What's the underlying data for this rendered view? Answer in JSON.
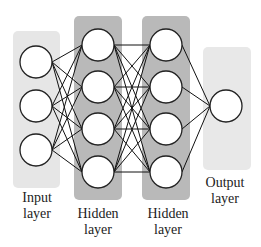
{
  "diagram": {
    "type": "neural-network",
    "layers": [
      {
        "name": "Input layer",
        "line1": "Input",
        "line2": "layer",
        "nodes": 3,
        "panel_color": "#e8e8e8"
      },
      {
        "name": "Hidden layer",
        "line1": "Hidden",
        "line2": "layer",
        "nodes": 4,
        "panel_color": "#b8b8b8"
      },
      {
        "name": "Hidden layer",
        "line1": "Hidden",
        "line2": "layer",
        "nodes": 4,
        "panel_color": "#b8b8b8"
      },
      {
        "name": "Output layer",
        "line1": "Output",
        "line2": "layer",
        "nodes": 1,
        "panel_color": "#e8e8e8"
      }
    ],
    "connectivity": "fully-connected"
  }
}
